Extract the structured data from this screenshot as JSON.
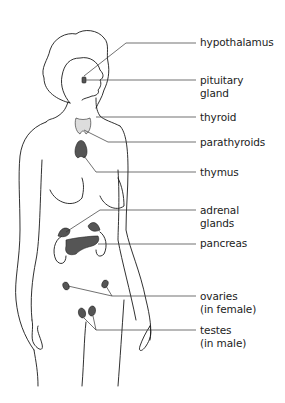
{
  "diagram": {
    "labels": [
      {
        "id": "hypothalamus",
        "line1": "hypothalamus",
        "line2": ""
      },
      {
        "id": "pituitary",
        "line1": "pituitary",
        "line2": "gland"
      },
      {
        "id": "thyroid",
        "line1": "thyroid",
        "line2": ""
      },
      {
        "id": "parathyroids",
        "line1": "parathyroids",
        "line2": ""
      },
      {
        "id": "thymus",
        "line1": "thymus",
        "line2": ""
      },
      {
        "id": "adrenal",
        "line1": "adrenal",
        "line2": "glands"
      },
      {
        "id": "pancreas",
        "line1": "pancreas",
        "line2": ""
      },
      {
        "id": "ovaries",
        "line1": "ovaries",
        "line2": "(in female)"
      },
      {
        "id": "testes",
        "line1": "testes",
        "line2": "(in male)"
      }
    ],
    "colors": {
      "outline": "#1a1a1a",
      "organ_fill": "#555555",
      "leader": "#333333"
    }
  }
}
